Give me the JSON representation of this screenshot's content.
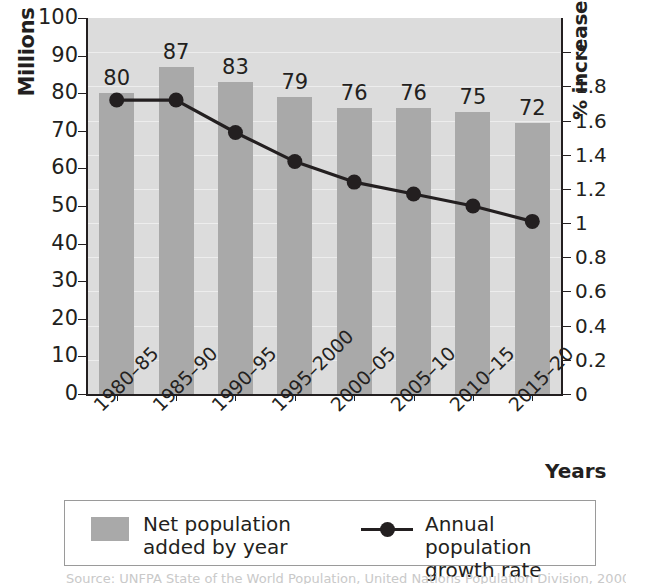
{
  "chart_data": {
    "type": "bar",
    "title": "",
    "categories": [
      "1980–85",
      "1985–90",
      "1990–95",
      "1995–2000",
      "2000–05",
      "2005–10",
      "2010–15",
      "2015–20"
    ],
    "xlabel": "Years",
    "ylabel": "Millions",
    "ylabel_right": "% increase per year",
    "ylim": [
      0,
      100
    ],
    "ylim_right": [
      0,
      2.2
    ],
    "yticks": [
      0,
      10,
      20,
      30,
      40,
      50,
      60,
      70,
      80,
      90,
      100
    ],
    "yticks_right": [
      0,
      0.2,
      0.4,
      0.6,
      0.8,
      1,
      1.2,
      1.4,
      1.6,
      1.8,
      2
    ],
    "ytick_labels": [
      "0",
      "10",
      "20",
      "30",
      "40",
      "50",
      "60",
      "70",
      "80",
      "90",
      "100"
    ],
    "ytick_labels_right": [
      "0",
      "0.2",
      "0.4",
      "0.6",
      "0.8",
      "1",
      "1.2",
      "1.4",
      "1.6",
      "1.8",
      "2"
    ],
    "grid": true,
    "legend_position": "below-plot",
    "series": [
      {
        "name": "Net population\nadded by year",
        "type": "bar",
        "axis": "left",
        "color": "#a9a9a9",
        "values": [
          80,
          87,
          83,
          79,
          76,
          76,
          75,
          72
        ],
        "data_labels": [
          "80",
          "87",
          "83",
          "79",
          "76",
          "76",
          "75",
          "72"
        ]
      },
      {
        "name": "Annual population\ngrowth rate",
        "type": "line",
        "axis": "right",
        "color": "#231f20",
        "values": [
          1.72,
          1.72,
          1.53,
          1.36,
          1.24,
          1.17,
          1.1,
          1.01
        ]
      }
    ]
  },
  "legend": {
    "items": [
      {
        "label": "Net population\nadded by year",
        "marker": "square-swatch"
      },
      {
        "label": "Annual population\ngrowth rate",
        "marker": "line-with-dot"
      }
    ]
  },
  "caption": {
    "text": "Source: UNFPA State of the World Population, United Nations Population Division, 2000"
  }
}
